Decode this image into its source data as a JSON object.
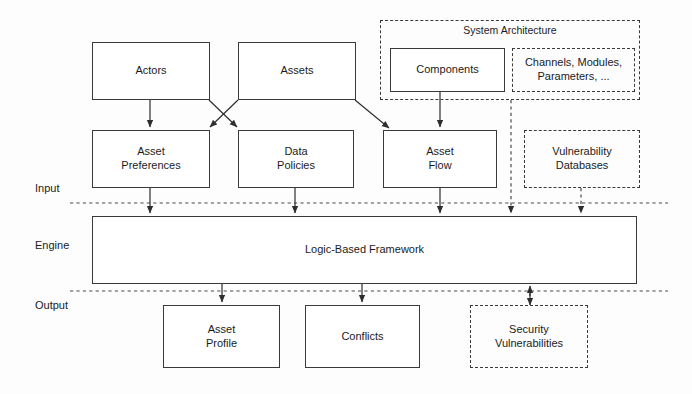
{
  "diagram": {
    "stroke_color": "#3a3a3a",
    "text_color": "#1b1b1b",
    "background": "#fdfdfd"
  },
  "bands": [
    {
      "id": "input",
      "label": "Input"
    },
    {
      "id": "engine",
      "label": "Engine"
    },
    {
      "id": "output",
      "label": "Output"
    }
  ],
  "groups": {
    "system_architecture": {
      "title": "System Architecture"
    }
  },
  "nodes": {
    "actors": {
      "label": "Actors",
      "style": "solid"
    },
    "assets": {
      "label": "Assets",
      "style": "solid"
    },
    "components": {
      "label": "Components",
      "style": "solid"
    },
    "channels_modules": {
      "label": "Channels, Modules,\nParameters, ...",
      "style": "dashed"
    },
    "asset_preferences": {
      "label": "Asset\nPreferences",
      "style": "solid"
    },
    "data_policies": {
      "label": "Data\nPolicies",
      "style": "solid"
    },
    "asset_flow": {
      "label": "Asset\nFlow",
      "style": "solid"
    },
    "vulnerability_databases": {
      "label": "Vulnerability\nDatabases",
      "style": "dashed"
    },
    "logic_framework": {
      "label": "Logic-Based Framework",
      "style": "solid"
    },
    "asset_profile": {
      "label": "Asset\nProfile",
      "style": "solid"
    },
    "conflicts": {
      "label": "Conflicts",
      "style": "solid"
    },
    "security_vulnerabilities": {
      "label": "Security\nVulnerabilities",
      "style": "dashed"
    }
  },
  "edges": [
    {
      "from": "actors",
      "to": "asset_preferences",
      "kind": "solid-arrow"
    },
    {
      "from": "actors",
      "to": "data_policies",
      "kind": "solid-arrow-diagonal"
    },
    {
      "from": "assets",
      "to": "asset_preferences",
      "kind": "solid-arrow-diagonal"
    },
    {
      "from": "assets",
      "to": "asset_flow",
      "kind": "solid-arrow-diagonal"
    },
    {
      "from": "components",
      "to": "asset_flow",
      "kind": "solid-arrow"
    },
    {
      "from": "asset_preferences",
      "to": "logic_framework",
      "kind": "solid-arrow"
    },
    {
      "from": "data_policies",
      "to": "logic_framework",
      "kind": "solid-arrow"
    },
    {
      "from": "asset_flow",
      "to": "logic_framework",
      "kind": "solid-arrow"
    },
    {
      "from": "system_architecture",
      "to": "logic_framework",
      "kind": "dashed-arrow"
    },
    {
      "from": "vulnerability_databases",
      "to": "logic_framework",
      "kind": "dashed-arrow"
    },
    {
      "from": "logic_framework",
      "to": "asset_profile",
      "kind": "solid-arrow"
    },
    {
      "from": "logic_framework",
      "to": "conflicts",
      "kind": "solid-arrow"
    },
    {
      "from": "logic_framework",
      "to": "security_vulnerabilities",
      "kind": "dashed-bidirectional-arrow"
    }
  ]
}
